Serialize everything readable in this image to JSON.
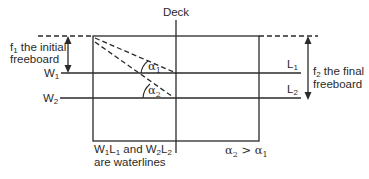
{
  "diagram": {
    "deck_label": "Deck",
    "left_annotation": {
      "line1_prefix": "f",
      "line1_sub": "1",
      "line1_suffix": " the initial",
      "line2": "freeboard"
    },
    "right_annotation": {
      "line1_prefix": "f",
      "line1_sub": "2",
      "line1_suffix": " the final",
      "line2": "freeboard"
    },
    "waterlines": {
      "w1": {
        "letter": "W",
        "sub": "1"
      },
      "w2": {
        "letter": "W",
        "sub": "2"
      },
      "l1": {
        "letter": "L",
        "sub": "1"
      },
      "l2": {
        "letter": "L",
        "sub": "2"
      }
    },
    "angles": {
      "a1": {
        "symbol": "α",
        "sub": "1"
      },
      "a2": {
        "symbol": "α",
        "sub": "2"
      }
    },
    "note_waterlines": {
      "line1_parts": [
        "W",
        "1",
        "L",
        "1",
        " and W",
        "2",
        "L",
        "2"
      ],
      "line2": "are  waterlines"
    },
    "note_angles": {
      "parts": [
        "α",
        "2",
        " > α",
        "1"
      ]
    },
    "line_color": "#2a2a2a"
  }
}
